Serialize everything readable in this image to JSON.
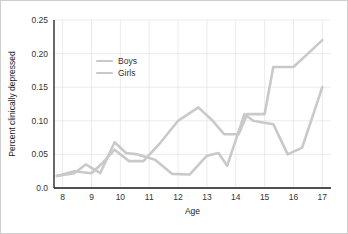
{
  "chart_data": {
    "type": "line",
    "title": "",
    "xlabel": "Age",
    "ylabel": "Percent clinically depressed",
    "xlim": [
      7.7,
      17.3
    ],
    "ylim": [
      0.0,
      0.25
    ],
    "xticks": [
      "8",
      "9",
      "10",
      "11",
      "12",
      "13",
      "14",
      "15",
      "16",
      "17"
    ],
    "xtick_values": [
      8,
      9,
      10,
      11,
      12,
      13,
      14,
      15,
      16,
      17
    ],
    "yticks": [
      "0.0",
      "0.05",
      "0.10",
      "0.15",
      "0.20",
      "0.25"
    ],
    "ytick_values": [
      0.0,
      0.05,
      0.1,
      0.15,
      0.2,
      0.25
    ],
    "grid": true,
    "legend_position": "upper-left-inside",
    "series": [
      {
        "name": "Boys",
        "color": "#c9c9c9",
        "x": [
          7.8,
          8.4,
          8.8,
          9.3,
          9.8,
          10.2,
          10.6,
          11.2,
          11.8,
          12.4,
          13.0,
          13.4,
          13.7,
          14.3,
          14.6,
          15.3,
          15.8,
          16.3,
          17.0
        ],
        "y": [
          0.018,
          0.022,
          0.035,
          0.022,
          0.068,
          0.052,
          0.05,
          0.042,
          0.021,
          0.02,
          0.048,
          0.052,
          0.033,
          0.11,
          0.1,
          0.095,
          0.05,
          0.06,
          0.15
        ]
      },
      {
        "name": "Girls",
        "color": "#c9c9c9",
        "x": [
          7.8,
          8.4,
          9.0,
          9.4,
          9.8,
          10.3,
          10.8,
          11.4,
          12.0,
          12.7,
          13.2,
          13.6,
          14.1,
          14.4,
          15.0,
          15.3,
          16.0,
          16.5,
          17.0
        ],
        "y": [
          0.018,
          0.025,
          0.022,
          0.038,
          0.057,
          0.04,
          0.04,
          0.068,
          0.1,
          0.12,
          0.1,
          0.08,
          0.08,
          0.11,
          0.11,
          0.18,
          0.18,
          0.2,
          0.22
        ]
      }
    ],
    "legend": [
      {
        "label": "Boys",
        "color": "#c9c9c9"
      },
      {
        "label": "Girls",
        "color": "#c9c9c9"
      }
    ]
  },
  "figure": {
    "background": "#ffffff",
    "border_color": "#cfcfcf",
    "grid_color": "#e2e2e2",
    "axis_color": "#1a1a1a"
  }
}
